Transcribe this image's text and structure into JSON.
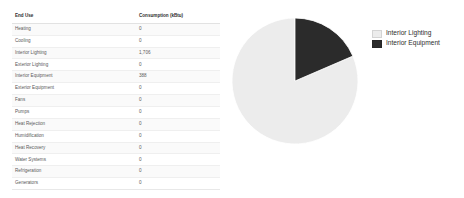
{
  "table": {
    "columns": [
      "End Use",
      "Consumption (kBtu)"
    ],
    "rows": [
      {
        "end_use": "Heating",
        "consumption": "0"
      },
      {
        "end_use": "Cooling",
        "consumption": "0"
      },
      {
        "end_use": "Interior Lighting",
        "consumption": "1,706"
      },
      {
        "end_use": "Exterior Lighting",
        "consumption": "0"
      },
      {
        "end_use": "Interior Equipment",
        "consumption": "388"
      },
      {
        "end_use": "Exterior Equipment",
        "consumption": "0"
      },
      {
        "end_use": "Fans",
        "consumption": "0"
      },
      {
        "end_use": "Pumps",
        "consumption": "0"
      },
      {
        "end_use": "Heat Rejection",
        "consumption": "0"
      },
      {
        "end_use": "Humidification",
        "consumption": "0"
      },
      {
        "end_use": "Heat Recovery",
        "consumption": "0"
      },
      {
        "end_use": "Water Systems",
        "consumption": "0"
      },
      {
        "end_use": "Refrigeration",
        "consumption": "0"
      },
      {
        "end_use": "Generators",
        "consumption": "0"
      }
    ]
  },
  "chart_data": {
    "type": "pie",
    "title": "",
    "categories": [
      "Interior Lighting",
      "Interior Equipment"
    ],
    "values": [
      1706,
      388
    ],
    "unit": "kBtu",
    "percentages": [
      81.5,
      18.5
    ],
    "colors": [
      "#ececec",
      "#2b2b2b"
    ],
    "start_angle_deg": 0,
    "direction": "counterclockwise",
    "legend_position": "right",
    "grid": false
  },
  "legend": {
    "entries": [
      {
        "label": "Interior Lighting",
        "color": "#ececec"
      },
      {
        "label": "Interior Equipment",
        "color": "#2b2b2b"
      }
    ]
  }
}
